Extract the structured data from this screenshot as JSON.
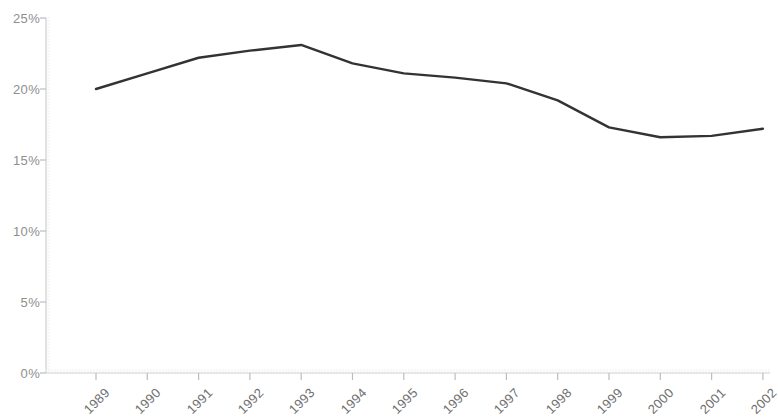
{
  "chart_data": {
    "type": "line",
    "title": "",
    "subtitle": "",
    "xlabel": "",
    "ylabel": "",
    "categories": [
      "1989",
      "1990",
      "1991",
      "1992",
      "1993",
      "1994",
      "1995",
      "1996",
      "1997",
      "1998",
      "1999",
      "2000",
      "2001",
      "2002"
    ],
    "values": [
      20.0,
      21.1,
      22.2,
      22.7,
      23.1,
      21.8,
      21.1,
      20.8,
      20.4,
      19.2,
      17.3,
      16.6,
      16.7,
      17.2
    ],
    "ylim": [
      0,
      25
    ],
    "yticks": [
      0,
      5,
      10,
      15,
      20,
      25
    ],
    "ytick_labels": [
      "0%",
      "5%",
      "10%",
      "15%",
      "20%",
      "25%"
    ],
    "xtick_labels": [
      "1989",
      "1990",
      "1991",
      "1992",
      "1993",
      "1994",
      "1995",
      "1996",
      "1997",
      "1998",
      "1999",
      "2000",
      "2001",
      "2002"
    ],
    "grid": false,
    "legend": null,
    "legend_position": "none",
    "series": [
      {
        "name": "series-1",
        "values": [
          20.0,
          21.1,
          22.2,
          22.7,
          23.1,
          21.8,
          21.1,
          20.8,
          20.4,
          19.2,
          17.3,
          16.6,
          16.7,
          17.2
        ]
      }
    ],
    "annotations": []
  },
  "style": {
    "line_color": "#333333",
    "axis_color": "#cfcfcf",
    "tick_color": "#bdbdbd",
    "ytick_text_color": "#8e8e8e",
    "xtick_text_color": "#6f6f6f",
    "background": "#ffffff"
  },
  "geometry": {
    "plot_left": 46,
    "plot_right": 770,
    "plot_top": 18,
    "plot_bottom": 373,
    "x_first": 96,
    "x_step": 51.3
  }
}
